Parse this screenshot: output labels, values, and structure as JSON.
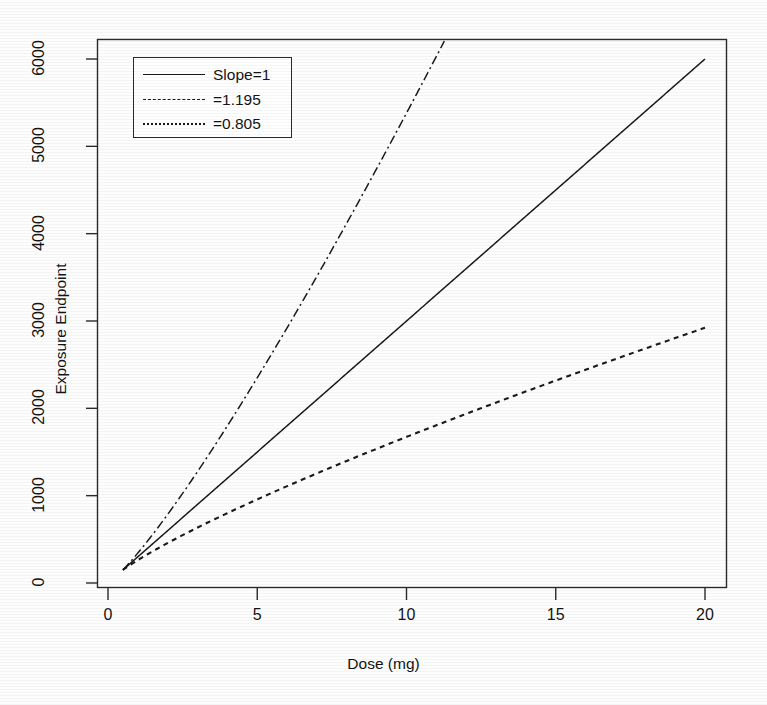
{
  "chart_data": {
    "type": "line",
    "title": "",
    "xlabel": "Dose (mg)",
    "ylabel": "Exposure Endpoint",
    "xlim": [
      0,
      21
    ],
    "ylim": [
      0,
      6200
    ],
    "xticks": [
      "0",
      "5",
      "10",
      "15",
      "20"
    ],
    "xtick_values": [
      0,
      5,
      10,
      15,
      20
    ],
    "yticks": [
      "0",
      "1000",
      "2000",
      "3000",
      "4000",
      "5000",
      "6000"
    ],
    "ytick_values": [
      0,
      1000,
      2000,
      3000,
      4000,
      5000,
      6000
    ],
    "grid": false,
    "legend_position": "top-left",
    "series": [
      {
        "name": "Slope=1",
        "slope": 1,
        "style": "solid",
        "color": "#1a1a1a",
        "x": [
          0.5,
          1,
          2,
          3,
          5,
          7.5,
          10,
          12.5,
          15,
          17.5,
          20
        ],
        "values": [
          150,
          300,
          600,
          900,
          1500,
          2250,
          3000,
          3750,
          4500,
          5250,
          6000
        ]
      },
      {
        "name": "=1.195",
        "slope": 1.195,
        "style": "dashdot",
        "color": "#1a1a1a",
        "x": [
          0.5,
          1,
          2,
          3,
          5,
          7.5,
          10,
          12.5,
          12.63
        ],
        "values": [
          150,
          344,
          787,
          1265,
          2300,
          3706,
          5196,
          6765,
          6850
        ]
      },
      {
        "name": "=0.805",
        "slope": 0.805,
        "style": "dashed",
        "color": "#1a1a1a",
        "x": [
          0.5,
          1,
          2,
          3,
          5,
          7.5,
          10,
          12.5,
          15,
          17.5,
          20
        ],
        "values": [
          150,
          262,
          458,
          637,
          963,
          1340,
          1686,
          2012,
          2323,
          2622,
          2911
        ]
      }
    ],
    "annotations": [
      "All three curves originate from a common point near dose 0.5 mg.",
      "The slope=1.195 curve exits the top of the plot region near dose 12.6 mg.",
      "The slope=0.805 curve ends near 3320 at dose 20 mg."
    ]
  },
  "legend": {
    "entries": [
      {
        "label": "Slope=1",
        "key": "solid-line-key"
      },
      {
        "label": "=1.195",
        "key": "dash-dot-line-key"
      },
      {
        "label": "=0.805",
        "key": "dashed-line-key"
      }
    ]
  },
  "axes": {
    "x_title": "Dose (mg)",
    "y_title": "Exposure Endpoint",
    "x_tick_labels": [
      "0",
      "5",
      "10",
      "15",
      "20"
    ],
    "y_tick_labels": [
      "0",
      "1000",
      "2000",
      "3000",
      "4000",
      "5000",
      "6000"
    ]
  }
}
